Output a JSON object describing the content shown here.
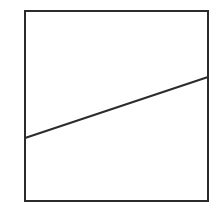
{
  "figure": {
    "kind": "line-plot",
    "background_color": "#ffffff",
    "canvas": {
      "width": 223,
      "height": 212
    },
    "frame": {
      "name": "plot-frame",
      "x": 24,
      "y": 10,
      "width": 185,
      "height": 192,
      "stroke_color": "#2b2b2b",
      "stroke_width": 2,
      "fill_color": "#ffffff"
    },
    "line": {
      "name": "data-line",
      "x1": 24,
      "y1": 138,
      "x2": 209,
      "y2": 77,
      "stroke_color": "#2b2b2b",
      "stroke_width": 2
    },
    "speck": {
      "cx": 126,
      "cy": 32,
      "r": 2,
      "color": "#f2f2f2"
    }
  },
  "chart_data": {
    "type": "line",
    "title": "",
    "subtitle": "",
    "xlabel": "",
    "ylabel": "",
    "x": [
      0,
      1
    ],
    "series": [
      {
        "name": "",
        "values": [
          0.333,
          0.651
        ]
      }
    ],
    "xlim": [
      0,
      1
    ],
    "ylim": [
      0,
      1
    ],
    "grid": false,
    "legend": false,
    "legend_position": "none",
    "xtick_labels": [],
    "ytick_labels": [],
    "annotations": []
  }
}
